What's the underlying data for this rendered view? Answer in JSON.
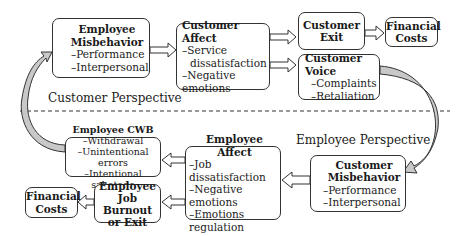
{
  "diagram": {
    "sections": {
      "customer_perspective": "Customer Perspective",
      "employee_perspective": "Employee Perspective"
    },
    "nodes": {
      "employee_misbehavior": {
        "title_line1": "Employee",
        "title_line2": "Misbehavior",
        "items": [
          "–Performance",
          "–Interpersonal"
        ]
      },
      "customer_affect": {
        "title": "Customer Affect",
        "items": [
          "–Service",
          "dissatisfaction",
          "–Negative emotions"
        ]
      },
      "customer_exit": {
        "title_line1": "Customer",
        "title_line2": "Exit"
      },
      "financial_costs_top": {
        "title_line1": "Financial",
        "title_line2": "Costs"
      },
      "customer_voice": {
        "title": "Customer Voice",
        "items": [
          "–Complaints",
          "–Retaliation"
        ]
      },
      "customer_misbehavior": {
        "title_line1": "Customer",
        "title_line2": "Misbehavior",
        "items": [
          "–Performance",
          "–Interpersonal"
        ]
      },
      "employee_affect": {
        "title": "Employee Affect",
        "items": [
          "–Job dissatisfaction",
          "–Negative emotions",
          "–Emotions regulation"
        ]
      },
      "employee_cwb": {
        "title": "Employee CWB",
        "items": [
          "–Withdrawal",
          "–Unintentional errors",
          "–Intentional sabotage"
        ]
      },
      "employee_burnout": {
        "title_line1": "Employee",
        "title_line2": "Job Burnout",
        "title_line3": "or Exit"
      },
      "financial_costs_bottom": {
        "title_line1": "Financial",
        "title_line2": "Costs"
      }
    },
    "edges": [
      {
        "from": "employee_misbehavior",
        "to": "customer_affect",
        "style": "hollow-arrow"
      },
      {
        "from": "customer_affect",
        "to": "customer_exit",
        "style": "hollow-arrow"
      },
      {
        "from": "customer_affect",
        "to": "customer_voice",
        "style": "hollow-arrow"
      },
      {
        "from": "customer_exit",
        "to": "financial_costs_top",
        "style": "hollow-arrow"
      },
      {
        "from": "customer_voice",
        "to": "customer_misbehavior",
        "style": "curved-arrow"
      },
      {
        "from": "customer_misbehavior",
        "to": "employee_affect",
        "style": "hollow-arrow"
      },
      {
        "from": "employee_affect",
        "to": "employee_cwb",
        "style": "hollow-arrow"
      },
      {
        "from": "employee_affect",
        "to": "employee_burnout",
        "style": "hollow-arrow"
      },
      {
        "from": "employee_burnout",
        "to": "financial_costs_bottom",
        "style": "hollow-arrow"
      },
      {
        "from": "employee_cwb",
        "to": "employee_misbehavior",
        "style": "curved-arrow"
      }
    ],
    "colors": {
      "stroke": "#333333",
      "curve_fill": "#c8c8c8",
      "background": "#ffffff"
    }
  }
}
